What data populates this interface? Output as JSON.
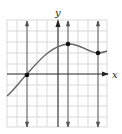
{
  "labels": {
    "x_axis": "x",
    "y_axis": "y"
  },
  "grid": {
    "x_min": -5,
    "x_max": 5,
    "y_min": -5,
    "y_max": 5,
    "cell": 1
  },
  "points": [
    {
      "x": -3,
      "y": 0
    },
    {
      "x": 1,
      "y": 3
    },
    {
      "x": 4,
      "y": 2
    }
  ],
  "vertical_lines_x": [
    -3,
    1,
    4
  ],
  "colors": {
    "grid": "#cfcfcf",
    "axis": "#222222",
    "curve": "#555555",
    "point": "#111111"
  }
}
